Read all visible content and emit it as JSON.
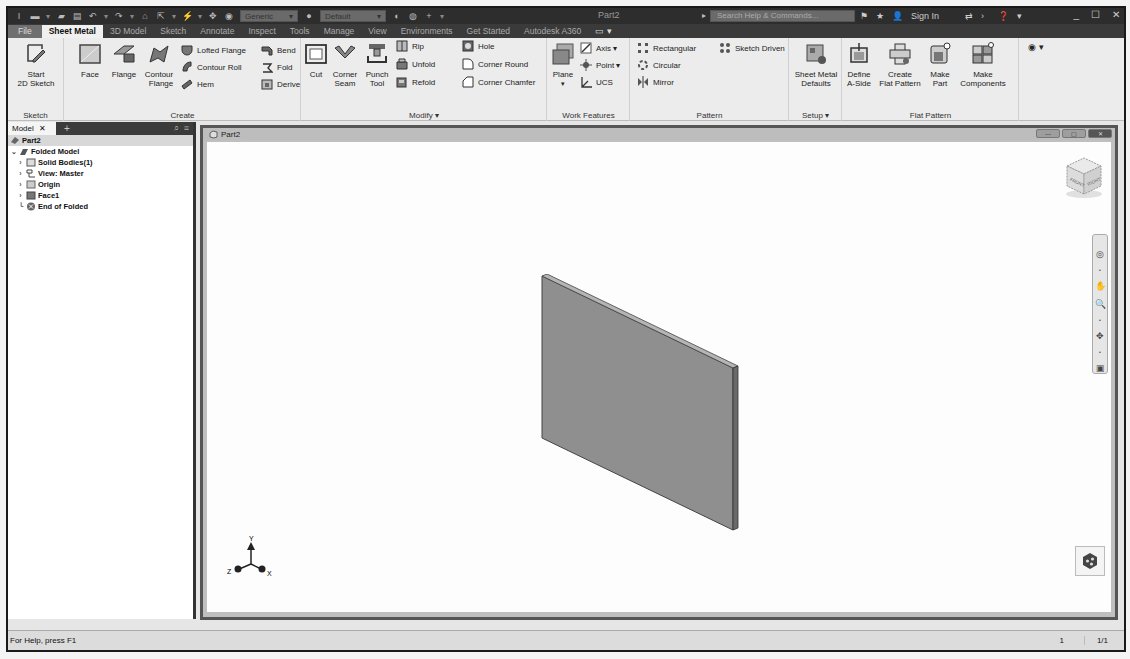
{
  "titlebar": {
    "app_icon": "inventor-logo-icon",
    "qat_icons": [
      "new-icon",
      "open-icon",
      "save-icon",
      "undo-icon",
      "redo-icon",
      "home-icon",
      "select-icon",
      "update-icon",
      "measure-icon",
      "color-icon"
    ],
    "material_dropdown": "Generic",
    "appearance_dropdown": "Default",
    "title": "Part2",
    "search_placeholder": "Search Help & Commands...",
    "sign_in": "Sign In",
    "help": "?"
  },
  "ribbon_tabs": [
    {
      "label": "File"
    },
    {
      "label": "Sheet Metal",
      "active": true
    },
    {
      "label": "3D Model"
    },
    {
      "label": "Sketch"
    },
    {
      "label": "Annotate"
    },
    {
      "label": "Inspect"
    },
    {
      "label": "Tools"
    },
    {
      "label": "Manage"
    },
    {
      "label": "View"
    },
    {
      "label": "Environments"
    },
    {
      "label": "Get Started"
    },
    {
      "label": "Autodesk A360"
    }
  ],
  "ribbon": {
    "sketch": {
      "title": "Sketch",
      "start_sketch": "Start\n2D Sketch"
    },
    "create": {
      "title": "Create",
      "face": "Face",
      "flange": "Flange",
      "contour_flange": "Contour\nFlange",
      "lofted_flange": "Lofted Flange",
      "contour_roll": "Contour Roll",
      "hem": "Hem",
      "bend": "Bend",
      "fold": "Fold",
      "derive": "Derive"
    },
    "modify": {
      "title": "Modify ▾",
      "cut": "Cut",
      "corner_seam": "Corner\nSeam",
      "punch_tool": "Punch\nTool",
      "rip": "Rip",
      "unfold": "Unfold",
      "refold": "Refold",
      "hole": "Hole",
      "corner_round": "Corner Round",
      "corner_chamfer": "Corner Chamfer"
    },
    "work_features": {
      "title": "Work Features",
      "plane": "Plane",
      "axis": "Axis ▾",
      "point": "Point ▾",
      "ucs": "UCS"
    },
    "pattern": {
      "title": "Pattern",
      "rectangular": "Rectangular",
      "circular": "Circular",
      "mirror": "Mirror",
      "sketch_driven": "Sketch Driven"
    },
    "setup": {
      "title": "Setup ▾",
      "sheet_metal_defaults": "Sheet Metal\nDefaults"
    },
    "flat_pattern": {
      "title": "Flat Pattern",
      "define_a_side": "Define\nA-Side",
      "create_flat_pattern": "Create\nFlat Pattern",
      "make_part": "Make\nPart",
      "make_components": "Make\nComponents"
    }
  },
  "browser": {
    "tab_label": "Model",
    "close": "✕",
    "add": "+",
    "tree": [
      {
        "label": "Part2",
        "level": 0,
        "icon": "part-icon"
      },
      {
        "label": "Folded Model",
        "level": 1,
        "icon": "folded-model-icon",
        "expanded": true
      },
      {
        "label": "Solid Bodies(1)",
        "level": 2,
        "icon": "solid-bodies-icon"
      },
      {
        "label": "View: Master",
        "level": 2,
        "icon": "view-icon"
      },
      {
        "label": "Origin",
        "level": 2,
        "icon": "origin-folder-icon"
      },
      {
        "label": "Face1",
        "level": 2,
        "icon": "face-feature-icon"
      },
      {
        "label": "End of Folded",
        "level": 2,
        "icon": "end-of-part-icon"
      }
    ]
  },
  "viewport": {
    "doc_title": "Part2",
    "triad": {
      "x": "X",
      "y": "Y",
      "z": "Z"
    },
    "viewcube": {
      "front": "FRONT",
      "right": "RIGHT"
    }
  },
  "statusbar": {
    "help_text": "For Help, press F1",
    "count": "1",
    "pages": "1/1"
  }
}
